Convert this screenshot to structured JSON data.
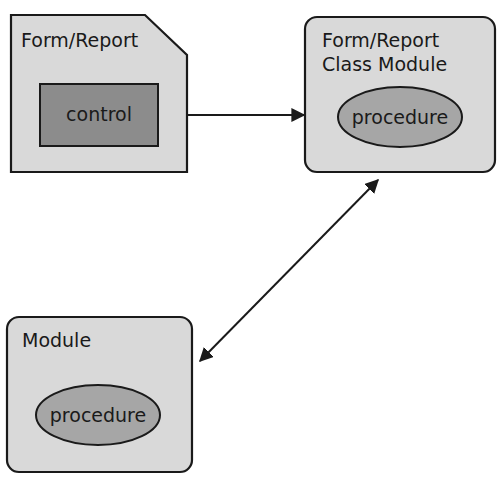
{
  "diagram": {
    "colors": {
      "box_fill": "#d9d9d9",
      "inner_fill": "#8c8c8c",
      "ellipse_fill": "#a6a6a6",
      "stroke": "#1a1a1a",
      "background": "#ffffff"
    },
    "nodes": {
      "form_report": {
        "title": "Form/Report",
        "child": "control"
      },
      "class_module": {
        "title_line1": "Form/Report",
        "title_line2": "Class Module",
        "child": "procedure"
      },
      "module": {
        "title": "Module",
        "child": "procedure"
      }
    },
    "edges": [
      {
        "from": "control",
        "to": "class_module",
        "type": "arrow"
      },
      {
        "from": "class_module",
        "to": "module",
        "type": "bidirectional-arrow"
      }
    ]
  }
}
